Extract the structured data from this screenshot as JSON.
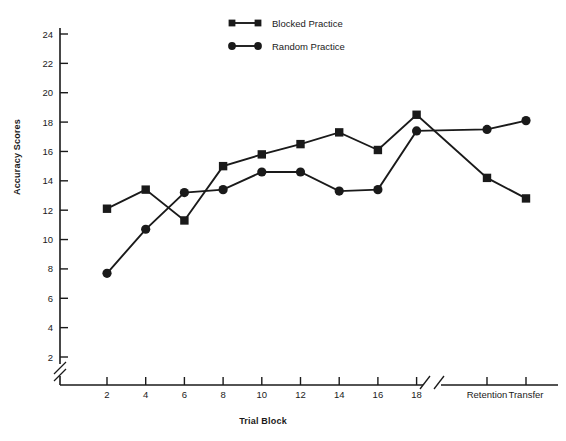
{
  "chart_data": {
    "type": "line",
    "title": "",
    "xlabel": "Trial Block",
    "ylabel": "Accuracy Scores",
    "ylim": [
      2,
      24
    ],
    "ytick_labels": [
      "2",
      "4",
      "6",
      "8",
      "10",
      "12",
      "14",
      "16",
      "18",
      "20",
      "22",
      "24"
    ],
    "ytick_values": [
      2,
      4,
      6,
      8,
      10,
      12,
      14,
      16,
      18,
      20,
      22,
      24
    ],
    "xtick_labels": [
      "2",
      "4",
      "6",
      "8",
      "10",
      "12",
      "14",
      "16",
      "18",
      "Retention",
      "Transfer"
    ],
    "categories": [
      "2",
      "4",
      "6",
      "8",
      "10",
      "12",
      "14",
      "16",
      "18",
      "Retention",
      "Transfer"
    ],
    "grid": false,
    "axis_break_x": true,
    "axis_break_y": true,
    "legend_position": "top-center",
    "series": [
      {
        "name": "Blocked Practice",
        "marker": "square",
        "color": "#1a1a1a",
        "values": [
          12.1,
          13.4,
          11.3,
          15.0,
          15.8,
          16.5,
          17.3,
          16.1,
          18.5,
          14.2,
          12.8
        ]
      },
      {
        "name": "Random Practice",
        "marker": "circle",
        "color": "#1a1a1a",
        "values": [
          7.7,
          10.7,
          13.2,
          13.4,
          14.6,
          14.6,
          13.3,
          13.4,
          17.4,
          17.5,
          18.1
        ]
      }
    ]
  },
  "legend": {
    "items": [
      {
        "label": "Blocked Practice",
        "marker": "square-marker"
      },
      {
        "label": "Random Practice",
        "marker": "circle-marker"
      }
    ]
  }
}
